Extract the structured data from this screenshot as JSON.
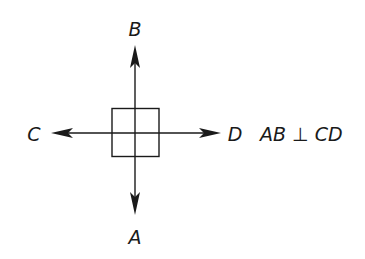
{
  "diagram": {
    "labels": {
      "top": "B",
      "bottom": "A",
      "left": "C",
      "right": "D"
    },
    "statement": "AB ⊥ CD",
    "colors": {
      "stroke": "#1a1a1a",
      "background": "#ffffff"
    },
    "elements": [
      "line AB (vertical, arrows both ends)",
      "line CD (horizontal, arrows both ends)",
      "right-angle box at intersection"
    ]
  }
}
